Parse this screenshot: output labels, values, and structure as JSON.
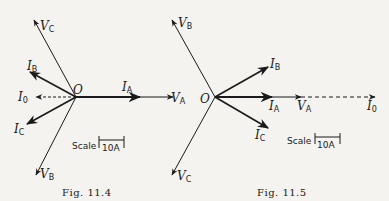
{
  "figures": [
    {
      "caption": "Fig. 11.4",
      "origin_label": "O",
      "vectors": {
        "VC": {
          "main": "V",
          "sub": "C"
        },
        "IB": {
          "main": "I",
          "sub": "B"
        },
        "I0": {
          "main": "I",
          "sub": "0"
        },
        "IC": {
          "main": "I",
          "sub": "C"
        },
        "VB": {
          "main": "V",
          "sub": "B"
        },
        "IA": {
          "main": "I",
          "sub": "A"
        },
        "VA": {
          "main": "V",
          "sub": "A"
        }
      },
      "scale_label": "Scale",
      "scale_value": "10A"
    },
    {
      "caption": "Fig. 11.5",
      "origin_label": "O",
      "vectors": {
        "VB": {
          "main": "V",
          "sub": "B"
        },
        "VC": {
          "main": "V",
          "sub": "C"
        },
        "IB": {
          "main": "I",
          "sub": "B"
        },
        "IA": {
          "main": "I",
          "sub": "A"
        },
        "VA": {
          "main": "V",
          "sub": "A"
        },
        "I0": {
          "main": "I",
          "sub": "0"
        },
        "IC": {
          "main": "I",
          "sub": "C"
        }
      },
      "scale_label": "Scale",
      "scale_value": "10A"
    }
  ]
}
